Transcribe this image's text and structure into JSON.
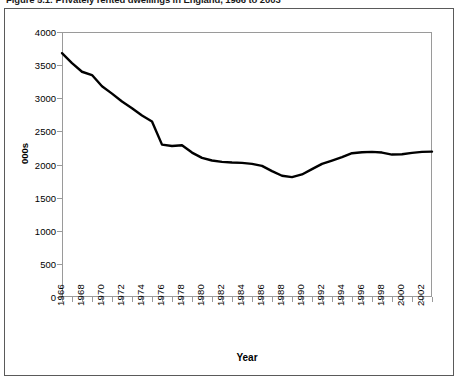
{
  "figure": {
    "caption": "Figure 5.1: Privately rented dwellings in England, 1966 to 2003"
  },
  "chart_data": {
    "type": "line",
    "title": "Figure 5.1: Privately rented dwellings in England, 1966 to 2003",
    "xlabel": "Year",
    "ylabel": "000s",
    "ylim": [
      0,
      4000
    ],
    "yticks": [
      0,
      500,
      1000,
      1500,
      2000,
      2500,
      3000,
      3500,
      4000
    ],
    "xlim": [
      1966,
      2003
    ],
    "xticks": [
      1966,
      1968,
      1970,
      1972,
      1974,
      1976,
      1978,
      1980,
      1982,
      1984,
      1986,
      1988,
      1990,
      1992,
      1994,
      1996,
      1998,
      2000,
      2002
    ],
    "grid": false,
    "legend": false,
    "line_color": "#000000",
    "x": [
      1966,
      1967,
      1968,
      1969,
      1970,
      1971,
      1972,
      1973,
      1974,
      1975,
      1976,
      1977,
      1978,
      1979,
      1980,
      1981,
      1982,
      1983,
      1984,
      1985,
      1986,
      1987,
      1988,
      1989,
      1990,
      1991,
      1992,
      1993,
      1994,
      1995,
      1996,
      1997,
      1998,
      1999,
      2000,
      2001,
      2002,
      2003
    ],
    "values": [
      3680,
      3530,
      3400,
      3350,
      3180,
      3070,
      2950,
      2850,
      2740,
      2650,
      2300,
      2280,
      2290,
      2180,
      2100,
      2060,
      2040,
      2030,
      2025,
      2010,
      1980,
      1900,
      1830,
      1810,
      1850,
      1930,
      2010,
      2060,
      2110,
      2170,
      2185,
      2190,
      2180,
      2150,
      2155,
      2175,
      2190,
      2195
    ],
    "series": [
      {
        "name": "Privately rented dwellings",
        "values": [
          3680,
          3530,
          3400,
          3350,
          3180,
          3070,
          2950,
          2850,
          2740,
          2650,
          2300,
          2280,
          2290,
          2180,
          2100,
          2060,
          2040,
          2030,
          2025,
          2010,
          1980,
          1900,
          1830,
          1810,
          1850,
          1930,
          2010,
          2060,
          2110,
          2170,
          2185,
          2190,
          2180,
          2150,
          2155,
          2175,
          2190,
          2195
        ]
      }
    ]
  }
}
